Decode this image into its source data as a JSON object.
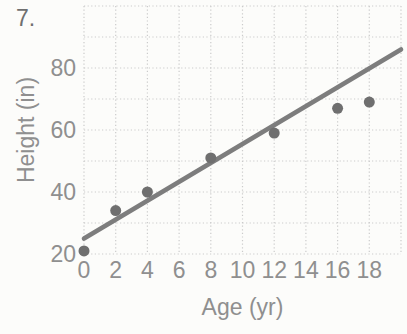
{
  "problem_number": "7.",
  "chart_data": {
    "type": "scatter",
    "title": "",
    "xlabel": "Age (yr)",
    "ylabel": "Height (in)",
    "x_ticks": [
      0,
      2,
      4,
      6,
      8,
      10,
      12,
      14,
      16,
      18
    ],
    "y_ticks": [
      20,
      40,
      60,
      80
    ],
    "xlim": [
      0,
      20
    ],
    "ylim": [
      20,
      100
    ],
    "grid": {
      "x_step": 2,
      "y_step": 10,
      "style": "dotted",
      "on": true
    },
    "points": [
      [
        0,
        21
      ],
      [
        2,
        34
      ],
      [
        4,
        40
      ],
      [
        8,
        51
      ],
      [
        12,
        59
      ],
      [
        16,
        67
      ],
      [
        18,
        69
      ]
    ],
    "trend_line": {
      "x1": 0,
      "y1": 25,
      "x2": 20,
      "y2": 86
    },
    "legend": "none",
    "colors": {
      "points": "#6f6f6f",
      "trend_line": "#7d7d7d",
      "grid": "#cbcbcb",
      "labels": "#8f8f8f"
    }
  }
}
